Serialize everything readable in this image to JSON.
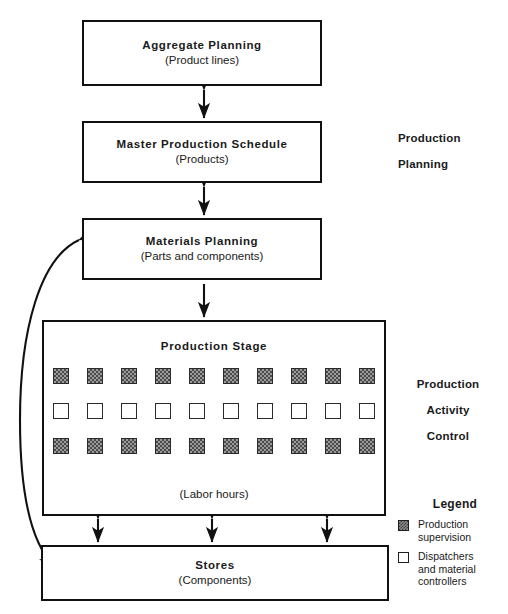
{
  "diagram": {
    "boxes": [
      {
        "id": "aggregate",
        "title": "Aggregate  Planning",
        "sub": "(Product lines)"
      },
      {
        "id": "mps",
        "title": "Master  Production  Schedule",
        "sub": "(Products)"
      },
      {
        "id": "materials",
        "title": "Materials Planning",
        "sub": "(Parts and components)"
      },
      {
        "id": "stage",
        "title": "Production  Stage",
        "sub": "(Labor hours)"
      },
      {
        "id": "stores",
        "title": "Stores",
        "sub": "(Components)"
      }
    ],
    "stage_grid": {
      "columns": 10,
      "rows": [
        {
          "kind": "filled",
          "count": 10
        },
        {
          "kind": "open",
          "count": 10
        },
        {
          "kind": "filled",
          "count": 10
        }
      ]
    },
    "side_labels": {
      "production_planning": [
        "Production",
        "Planning"
      ],
      "production_activity_control": [
        "Production",
        "Activity",
        "Control"
      ]
    },
    "legend": {
      "title": "Legend",
      "items": [
        {
          "swatch": "filled",
          "lines": [
            "Production",
            "supervision"
          ]
        },
        {
          "swatch": "open",
          "lines": [
            "Dispatchers",
            "and material",
            "controllers"
          ]
        }
      ]
    },
    "colors": {
      "stroke": "#111111",
      "fill_square": "#9a9a9a",
      "background": "#ffffff"
    }
  }
}
